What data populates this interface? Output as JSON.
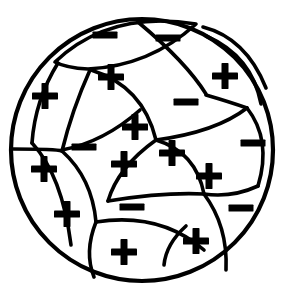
{
  "figure": {
    "title": "Mosaic of curved cells inside a circle",
    "description": "A large circle subdivided by arcs into irregular lens-shaped cells, each marked with a plus or minus sign.",
    "background_color": "#ffffff",
    "line_color": "#000000",
    "fill_color": "#ffffff",
    "outer_circle": {
      "center_x": 142,
      "center_y": 150,
      "radius": 131,
      "stroke_width": 4.2
    }
  },
  "legend": {
    "plus_symbol": "+",
    "minus_symbol": "−",
    "plus_count": 13,
    "minus_count": 7,
    "total_cells": 20
  },
  "cells": [
    {
      "id": "cell-01",
      "sign": "−",
      "x": 105,
      "y": 35,
      "size": 25
    },
    {
      "id": "cell-02",
      "sign": "−",
      "x": 168,
      "y": 38,
      "size": 25
    },
    {
      "id": "cell-03",
      "sign": "+",
      "x": 225,
      "y": 76,
      "size": 26
    },
    {
      "id": "cell-04",
      "sign": "+",
      "x": 111,
      "y": 77,
      "size": 26
    },
    {
      "id": "cell-05",
      "sign": "+",
      "x": 45,
      "y": 96,
      "size": 26
    },
    {
      "id": "cell-06",
      "sign": "−",
      "x": 186,
      "y": 102,
      "size": 25
    },
    {
      "id": "cell-07",
      "sign": "+",
      "x": 135,
      "y": 127,
      "size": 26
    },
    {
      "id": "cell-08",
      "sign": "−",
      "x": 84,
      "y": 147,
      "size": 25
    },
    {
      "id": "cell-09",
      "sign": "−",
      "x": 253,
      "y": 143,
      "size": 25
    },
    {
      "id": "cell-10",
      "sign": "+",
      "x": 172,
      "y": 153,
      "size": 26
    },
    {
      "id": "cell-11",
      "sign": "+",
      "x": 124,
      "y": 164,
      "size": 26
    },
    {
      "id": "cell-12",
      "sign": "+",
      "x": 44,
      "y": 169,
      "size": 26
    },
    {
      "id": "cell-13",
      "sign": "+",
      "x": 209,
      "y": 176,
      "size": 26
    },
    {
      "id": "cell-14",
      "sign": "−",
      "x": 241,
      "y": 208,
      "size": 25
    },
    {
      "id": "cell-15",
      "sign": "−",
      "x": 132,
      "y": 207,
      "size": 25
    },
    {
      "id": "cell-16",
      "sign": "+",
      "x": 67,
      "y": 214,
      "size": 26
    },
    {
      "id": "cell-17",
      "sign": "+",
      "x": 196,
      "y": 241,
      "size": 26
    },
    {
      "id": "cell-18",
      "sign": "+",
      "x": 124,
      "y": 252,
      "size": 26
    }
  ],
  "dividers": [
    {
      "id": "div-01",
      "d": "M 55 62 Q 110 10 196 24 Q 150 66 88 69 Q 66 68 55 62 Z",
      "kind": "lens-closed"
    },
    {
      "id": "div-02",
      "d": "M 138 22 Q 186 62 206 94",
      "kind": "arc"
    },
    {
      "id": "div-03",
      "d": "M 203 27 Q 246 38 266 88",
      "kind": "arc"
    },
    {
      "id": "div-04",
      "d": "M 206 36 Q 252 56 261 104",
      "kind": "arc"
    },
    {
      "id": "div-05",
      "d": "M 58 63 Q 35 100 32 143",
      "kind": "arc"
    },
    {
      "id": "div-06",
      "d": "M 90 70 Q 72 110 62 151",
      "kind": "arc"
    },
    {
      "id": "div-07",
      "d": "M 91 70 Q 143 86 156 140",
      "kind": "arc"
    },
    {
      "id": "div-08",
      "d": "M 62 150 Q 104 142 140 110",
      "kind": "arc"
    },
    {
      "id": "div-09",
      "d": "M 13 149 Q 56 149 62 151",
      "kind": "arc"
    },
    {
      "id": "div-10",
      "d": "M 62 151 Q 92 178 96 222",
      "kind": "arc"
    },
    {
      "id": "div-11",
      "d": "M 32 143 Q 62 175 71 245",
      "kind": "arc"
    },
    {
      "id": "div-12",
      "d": "M 156 140 Q 118 167 108 201",
      "kind": "arc"
    },
    {
      "id": "div-13",
      "d": "M 156 140 Q 196 152 204 194",
      "kind": "arc"
    },
    {
      "id": "div-14",
      "d": "M 156 140 Q 216 132 247 108",
      "kind": "arc"
    },
    {
      "id": "div-15",
      "d": "M 206 95 Q 230 102 247 108",
      "kind": "arc"
    },
    {
      "id": "div-16",
      "d": "M 247 108 Q 272 140 258 186",
      "kind": "arc"
    },
    {
      "id": "div-17",
      "d": "M 204 194 Q 232 198 258 186",
      "kind": "arc"
    },
    {
      "id": "div-18",
      "d": "M 204 194 Q 228 226 226 270",
      "kind": "arc"
    },
    {
      "id": "div-19",
      "d": "M 108 201 Q 164 192 204 194",
      "kind": "arc"
    },
    {
      "id": "div-20",
      "d": "M 96 222 Q 160 212 204 250",
      "kind": "arc"
    },
    {
      "id": "div-21",
      "d": "M 96 222 Q 84 252 94 277",
      "kind": "arc"
    },
    {
      "id": "div-22",
      "d": "M 164 265 Q 166 244 186 226",
      "kind": "arc"
    }
  ]
}
